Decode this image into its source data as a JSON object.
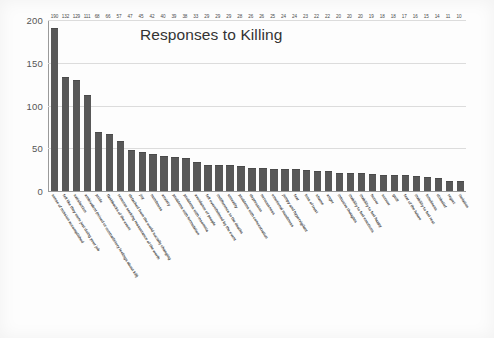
{
  "chart_data": {
    "type": "bar",
    "title": "Responses to Killing",
    "xlabel": "",
    "ylabel": "",
    "ylim": [
      0,
      200
    ],
    "yticks": [
      0,
      50,
      100,
      150,
      200
    ],
    "grid": true,
    "legend": "none",
    "orientation": "vertical",
    "bar_color": "#585858",
    "categories": [
      "sense of mission accomplished",
      "felt like they were just doing your job",
      "satisfaction",
      "ambivalent (mixed or contradictory feelings about kill)",
      "pride",
      "flashbacks of the event",
      "remorse seeking reassurance of the worth",
      "detached from the world socially changing",
      "joy",
      "numbness",
      "anxiety",
      "problems with formulation",
      "problems with insomnia",
      "avoidance of people",
      "felt overwhelmed by the event",
      "indifference to the deaths",
      "unreality",
      "problems with concentration",
      "depression",
      "nervousness",
      "emotional numbness",
      "jumpy and hypervigilant",
      "fear",
      "loss of trust",
      "shame",
      "anger",
      "intrusive thoughts",
      "inability to feel emotions",
      "inability to feel happy",
      "horror",
      "sorrow",
      "guilt",
      "fear of the future",
      "inability to feel rest",
      "loneliness",
      "disbelief",
      "regret",
      "isolation"
    ],
    "values": [
      190,
      132,
      129,
      111,
      68,
      66,
      57,
      47,
      45,
      42,
      40,
      39,
      38,
      33,
      29,
      29,
      29,
      28,
      26,
      26,
      25,
      24,
      24,
      23,
      22,
      22,
      20,
      20,
      20,
      19,
      18,
      18,
      17,
      16,
      15,
      14,
      11,
      10
    ],
    "value_labels": [
      "190",
      "132",
      "129",
      "111",
      "68",
      "66",
      "57",
      "47",
      "45",
      "42",
      "40",
      "39",
      "38",
      "33",
      "29",
      "29",
      "29",
      "28",
      "26",
      "26",
      "25",
      "24",
      "24",
      "23",
      "22",
      "22",
      "20",
      "20",
      "20",
      "19",
      "18",
      "18",
      "17",
      "16",
      "15",
      "14",
      "11",
      "10"
    ],
    "ytick_labels": [
      "0",
      "50",
      "100",
      "150",
      "200"
    ]
  }
}
